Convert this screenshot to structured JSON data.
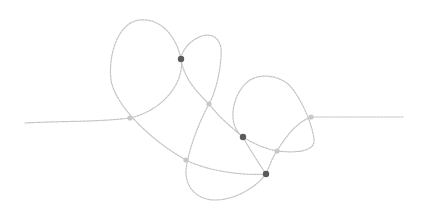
{
  "diagram": {
    "type": "knot-diagram",
    "colors": {
      "background": "#ffffff",
      "strand": "#c4c4c4",
      "dark_node": "#5a5a5a",
      "light_node": "#c8c8c8"
    },
    "strand_path": "M25,123 C60,121 100,122 130,118 C165,110 185,80 181,59 C176,35 160,18 140,20 C118,22 108,55 111,80 C115,105 150,140 186,160 C205,170 240,176 266,174 C255,188 235,200 215,200 C195,200 185,185 186,170 C188,150 200,120 209,104 C218,88 222,60 221,48 C219,38 212,33 202,36 C190,40 182,50 181,59 C184,80 200,95 209,104 C220,118 232,128 243,137 C255,145 270,150 277,151 C295,153 315,152 314,140 C313,125 300,95 288,84 C278,76 262,73 250,80 C238,88 232,105 233,118 C234,128 238,133 243,137 C250,150 260,165 266,174 C270,165 272,158 277,151 C288,133 298,122 311,117 C340,117 375,117 403,117",
    "nodes": [
      {
        "id": "n1",
        "x": 130,
        "y": 118,
        "kind": "light"
      },
      {
        "id": "n2",
        "x": 181,
        "y": 59,
        "kind": "dark"
      },
      {
        "id": "n3",
        "x": 209,
        "y": 104,
        "kind": "light"
      },
      {
        "id": "n4",
        "x": 186,
        "y": 160,
        "kind": "light"
      },
      {
        "id": "n5",
        "x": 243,
        "y": 137,
        "kind": "dark"
      },
      {
        "id": "n6",
        "x": 266,
        "y": 174,
        "kind": "dark"
      },
      {
        "id": "n7",
        "x": 277,
        "y": 151,
        "kind": "light"
      },
      {
        "id": "n8",
        "x": 311,
        "y": 117,
        "kind": "light"
      }
    ]
  }
}
